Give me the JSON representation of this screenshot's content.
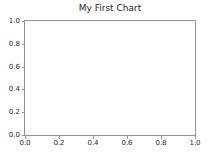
{
  "chart_data": {
    "type": "line",
    "title": "My First Chart",
    "xlabel": "",
    "ylabel": "",
    "xlim": [
      0.0,
      1.0
    ],
    "ylim": [
      0.0,
      1.0
    ],
    "xticks": [
      "0.0",
      "0.2",
      "0.4",
      "0.6",
      "0.8",
      "1.0"
    ],
    "xtick_values": [
      0.0,
      0.2,
      0.4,
      0.6,
      0.8,
      1.0
    ],
    "yticks": [
      "0.0",
      "0.2",
      "0.4",
      "0.6",
      "0.8",
      "1.0"
    ],
    "ytick_values": [
      0.0,
      0.2,
      0.4,
      0.6,
      0.8,
      1.0
    ],
    "grid": false,
    "legend": null,
    "series": [],
    "values": [],
    "categories": [],
    "annotations": [],
    "colors": {
      "figure_background": "#ffffff",
      "axes_background": "#ffffff",
      "spine": "#919191",
      "tick": "#919191",
      "text": "#262626"
    }
  }
}
